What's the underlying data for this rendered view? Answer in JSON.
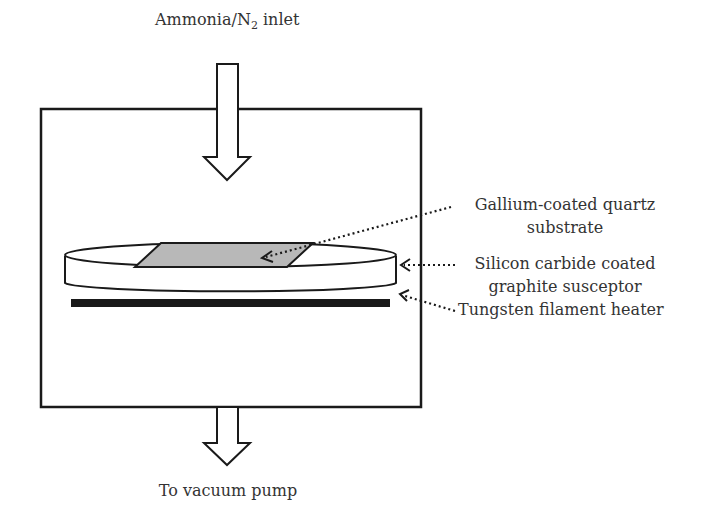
{
  "diagram": {
    "labels": {
      "inlet_prefix": "Ammonia/N",
      "inlet_sub": "2",
      "inlet_suffix": " inlet",
      "outlet": "To vacuum pump",
      "substrate_line1": "Gallium-coated quartz",
      "substrate_line2": "substrate",
      "susceptor_line1": "Silicon carbide coated",
      "susceptor_line2": "graphite susceptor",
      "heater": "Tungsten filament heater"
    },
    "colors": {
      "line": "#1a1a1a",
      "substrate_fill": "#b8b8b8",
      "heater_fill": "#1a1a1a",
      "text": "#333333",
      "background": "#ffffff"
    }
  }
}
